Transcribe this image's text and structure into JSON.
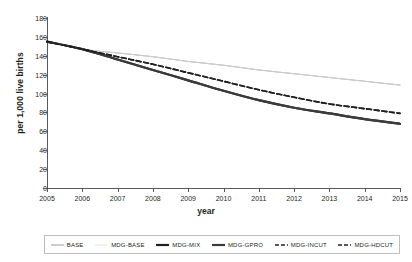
{
  "chart_data": {
    "type": "line",
    "title": "",
    "xlabel": "year",
    "ylabel": "per 1,000 live births",
    "x": [
      2005,
      2006,
      2007,
      2008,
      2009,
      2010,
      2011,
      2012,
      2013,
      2014,
      2015
    ],
    "xlim": [
      2005,
      2015
    ],
    "ylim": [
      0,
      180
    ],
    "yticks": [
      0,
      20,
      40,
      60,
      80,
      100,
      120,
      140,
      160,
      180
    ],
    "xticks": [
      "2005",
      "2006",
      "2007",
      "2008",
      "2009",
      "2010",
      "2011",
      "2012",
      "2013",
      "2014",
      "2015"
    ],
    "grid": false,
    "legend_position": "bottom",
    "series": [
      {
        "name": "BASE",
        "style": "thin-solid",
        "color": "#808285",
        "width": 0.8,
        "values": [
          155,
          147,
          143,
          139,
          134,
          130,
          125,
          121,
          117,
          113,
          109
        ]
      },
      {
        "name": "MDG-BASE",
        "style": "thin-solid-light",
        "color": "#d9dadb",
        "width": 0.8,
        "values": [
          155,
          147,
          143,
          139,
          134,
          130,
          125,
          121,
          117,
          113,
          109
        ]
      },
      {
        "name": "MDG-MIX",
        "style": "thick-solid",
        "color": "#231f20",
        "width": 2.2,
        "values": [
          155,
          147,
          136,
          125,
          114,
          103,
          93,
          85,
          79,
          73,
          68
        ]
      },
      {
        "name": "MDG-GPRO",
        "style": "thick-solid",
        "color": "#3b3b3d",
        "width": 2.2,
        "values": [
          155,
          147,
          136,
          125,
          114,
          103,
          93,
          85,
          79,
          73,
          68
        ]
      },
      {
        "name": "MDG-INCUT",
        "style": "dashed",
        "color": "#231f20",
        "width": 1.6,
        "values": [
          155,
          147,
          139,
          131,
          122,
          113,
          104,
          96,
          89,
          84,
          79
        ]
      },
      {
        "name": "MDG-HDCUT",
        "style": "dashed",
        "color": "#231f20",
        "width": 1.6,
        "values": [
          155,
          147,
          139,
          131,
          122,
          113,
          104,
          96,
          89,
          84,
          79
        ]
      }
    ]
  }
}
